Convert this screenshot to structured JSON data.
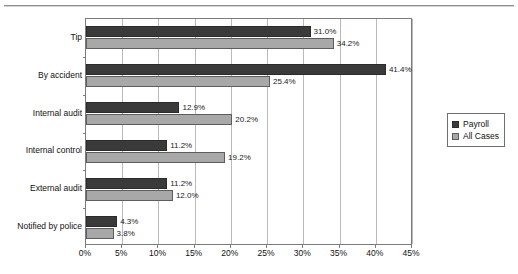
{
  "chart_data": {
    "type": "bar",
    "orientation": "horizontal",
    "title": "",
    "xlabel": "",
    "ylabel": "",
    "xlim": [
      0,
      45
    ],
    "xticks": [
      "0%",
      "5%",
      "10%",
      "15%",
      "20%",
      "25%",
      "30%",
      "35%",
      "40%",
      "45%"
    ],
    "xtick_values": [
      0,
      5,
      10,
      15,
      20,
      25,
      30,
      35,
      40,
      45
    ],
    "grid": true,
    "grid_axis": "x",
    "legend_position": "right",
    "categories": [
      "Tip",
      "By accident",
      "Internal audit",
      "Internal control",
      "External audit",
      "Notified by police"
    ],
    "series": [
      {
        "name": "Payroll",
        "color": "#3a3a3a",
        "values": [
          31.0,
          41.4,
          12.9,
          11.2,
          11.2,
          4.3
        ],
        "labels": [
          "31.0%",
          "41.4%",
          "12.9%",
          "11.2%",
          "11.2%",
          "4.3%"
        ]
      },
      {
        "name": "All Cases",
        "color": "#a8a8a8",
        "values": [
          34.2,
          25.4,
          20.2,
          19.2,
          12.0,
          3.8
        ],
        "labels": [
          "34.2%",
          "25.4%",
          "20.2%",
          "19.2%",
          "12.0%",
          "3.8%"
        ]
      }
    ]
  },
  "legend": {
    "entries": [
      {
        "label": "Payroll",
        "color": "#3a3a3a"
      },
      {
        "label": "All Cases",
        "color": "#a8a8a8"
      }
    ]
  }
}
